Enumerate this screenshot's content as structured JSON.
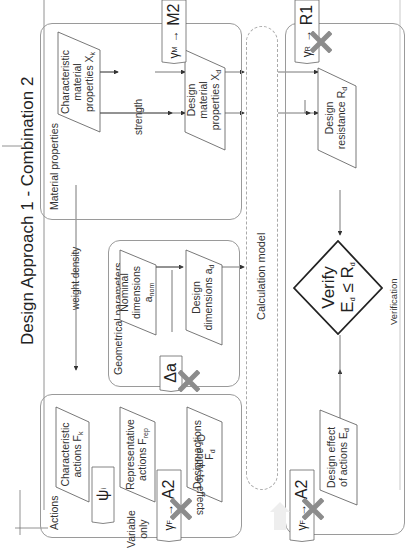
{
  "title": "Design Approach 1 - Combination 2",
  "groups": {
    "material": {
      "label": "Material properties"
    },
    "geometry": {
      "label": "Geometrical parameters"
    },
    "actions": {
      "label": "Actions"
    },
    "verification": {
      "label": "Verification"
    }
  },
  "boxes": {
    "char_material": {
      "line1": "Characteristic",
      "line2": "material",
      "line3": "properties X",
      "sub": "k"
    },
    "design_material": {
      "line1": "Design",
      "line2": "material",
      "line3": "properties X",
      "sub": "d"
    },
    "design_resistance": {
      "line1": "Design",
      "line2": "resistance R",
      "sub": "d"
    },
    "nominal_dims": {
      "line1": "Nominal",
      "line2": "dimensions",
      "line3": "a",
      "sub": "nom"
    },
    "design_dims": {
      "line1": "Design",
      "line2": "dimensions a",
      "sub": "d"
    },
    "char_actions": {
      "line1": "Characteristic",
      "line2": "actions F",
      "sub": "k"
    },
    "rep_actions": {
      "line1": "Representative",
      "line2": "actions F",
      "sub": "rep"
    },
    "design_actions": {
      "line1": "Design actions",
      "line2": "F",
      "sub": "d"
    },
    "design_effect": {
      "line1": "Design effect",
      "line2": "of actions E",
      "sub": "d"
    }
  },
  "calculation_model": {
    "label": "Calculation model"
  },
  "edges": {
    "strength": "strength",
    "weight_density": "weight density",
    "or_apply": "Or apply to effects",
    "variable_only": {
      "line1": "Variable",
      "line2": "only"
    }
  },
  "factors": {
    "gamma_m": {
      "symbol": "γ",
      "sub": "M",
      "arrow": "→",
      "set": "M2",
      "crossed": false
    },
    "gamma_r": {
      "symbol": "γ",
      "sub": "R",
      "arrow": "→",
      "set": "R1",
      "crossed": true
    },
    "delta_a": {
      "symbol": "Δa",
      "crossed": true
    },
    "psi": {
      "symbol": "ψ",
      "sub": "i"
    },
    "gamma_f_actions": {
      "symbol": "γ",
      "sub": "F",
      "arrow": "→",
      "set": "A2",
      "crossed": true
    },
    "gamma_f_effects": {
      "symbol": "γ",
      "sub": "F",
      "arrow": "→",
      "set": "A2",
      "crossed": true
    }
  },
  "verify": {
    "line1": "Verify",
    "lhs": "E",
    "lhs_sub": "d",
    "op": "≤",
    "rhs": "R",
    "rhs_sub": "d"
  },
  "colors": {
    "stroke": "#333333",
    "group_border": "#9a9a9a",
    "cross": "#8c8c8c",
    "dashed": "#aaaaaa"
  }
}
